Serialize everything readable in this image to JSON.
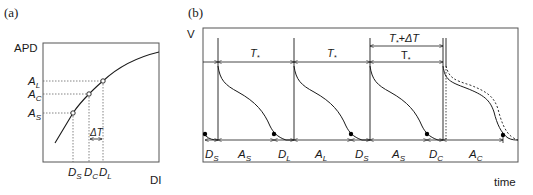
{
  "panel_a": {
    "label": "(a)",
    "y_axis_label": "APD",
    "x_axis_label": "DI",
    "y_ticks": [
      {
        "main": "A",
        "sub": "L"
      },
      {
        "main": "A",
        "sub": "C"
      },
      {
        "main": "A",
        "sub": "S"
      }
    ],
    "x_ticks": [
      {
        "main": "D",
        "sub": "S"
      },
      {
        "main": "D",
        "sub": "C"
      },
      {
        "main": "D",
        "sub": "L"
      }
    ],
    "delta_label": "ΔT",
    "colors": {
      "line": "#1a1a1a",
      "axis": "#555555"
    }
  },
  "panel_b": {
    "label": "(b)",
    "y_axis_label": "V",
    "x_axis_label": "time",
    "period_labels": [
      {
        "main": "T",
        "sub": "*"
      },
      {
        "main": "T",
        "sub": "*"
      },
      {
        "main": "T",
        "sub": "*"
      }
    ],
    "extended_period_label": {
      "main": "T",
      "sub": "*",
      "suffix": "+ΔT"
    },
    "interval_labels": [
      {
        "main": "D",
        "sub": "S"
      },
      {
        "main": "A",
        "sub": "S"
      },
      {
        "main": "D",
        "sub": "L"
      },
      {
        "main": "A",
        "sub": "L"
      },
      {
        "main": "D",
        "sub": "S"
      },
      {
        "main": "A",
        "sub": "S"
      },
      {
        "main": "D",
        "sub": "C"
      },
      {
        "main": "A",
        "sub": "C"
      }
    ],
    "colors": {
      "line": "#1a1a1a",
      "frame": "#555555"
    }
  }
}
